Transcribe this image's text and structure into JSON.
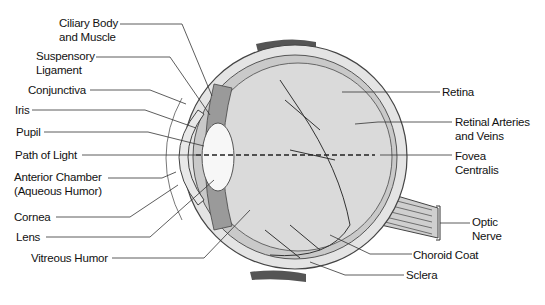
{
  "labels": {
    "left": [
      {
        "line1": "Ciliary Body",
        "line2": "and Muscle"
      },
      {
        "line1": "Suspensory",
        "line2": "Ligament"
      },
      {
        "line1": "Conjunctiva"
      },
      {
        "line1": "Iris"
      },
      {
        "line1": "Pupil"
      },
      {
        "line1": "Path of Light"
      },
      {
        "line1": "Anterior Chamber",
        "line2": "(Aqueous Humor)"
      },
      {
        "line1": "Cornea"
      },
      {
        "line1": "Lens"
      },
      {
        "line1": "Vitreous Humor"
      }
    ],
    "right": [
      {
        "line1": "Retina"
      },
      {
        "line1": "Retinal Arteries",
        "line2": "and Veins"
      },
      {
        "line1": "Fovea",
        "line2": "Centralis"
      },
      {
        "line1": "Optic",
        "line2": "Nerve"
      },
      {
        "line1": "Choroid Coat"
      },
      {
        "line1": "Sclera"
      }
    ]
  }
}
